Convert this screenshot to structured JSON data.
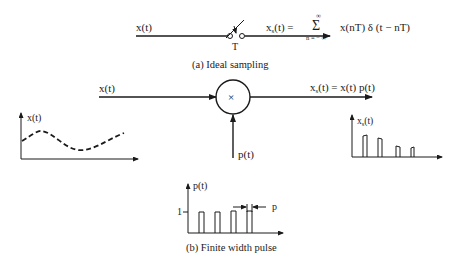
{
  "part_a": {
    "input_label": "x(t)",
    "switch_label": "T",
    "output_lhs": "x",
    "output_lhs_sub": "s",
    "output_lhs_rest": "(t) =",
    "sum_symbol": "Σ",
    "sum_upper": "∞",
    "sum_lower": "n = − ∞",
    "sum_body": "x(nT) δ (t − nT)",
    "caption": "(a)  Ideal sampling"
  },
  "part_b": {
    "input_label": "x(t)",
    "multiplier_symbol": "×",
    "pulse_input_label": "p(t)",
    "output_label_x": "x",
    "output_label_sub": "s",
    "output_label_rest": "(t) = x(t) p(t)",
    "input_plot_ylabel": "x(t)",
    "output_plot_ylabel_x": "x",
    "output_plot_ylabel_sub": "s",
    "output_plot_ylabel_rest": "(t)",
    "pulse_plot_ylabel": "p(t)",
    "pulse_amplitude_label": "1",
    "pulse_width_label": "p",
    "caption": "(b)  Finite width pulse"
  }
}
